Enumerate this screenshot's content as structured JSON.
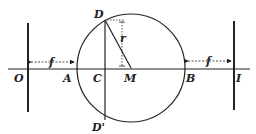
{
  "diagram": {
    "type": "geometric-optics",
    "labels": {
      "O": "O",
      "A": "A",
      "C": "C",
      "M": "M",
      "B": "B",
      "I": "I",
      "D": "D",
      "D_prime": "D'",
      "f_left": "f",
      "f_right": "f",
      "r": "r"
    },
    "colors": {
      "stroke": "#222222",
      "background": "#ffffff"
    }
  }
}
